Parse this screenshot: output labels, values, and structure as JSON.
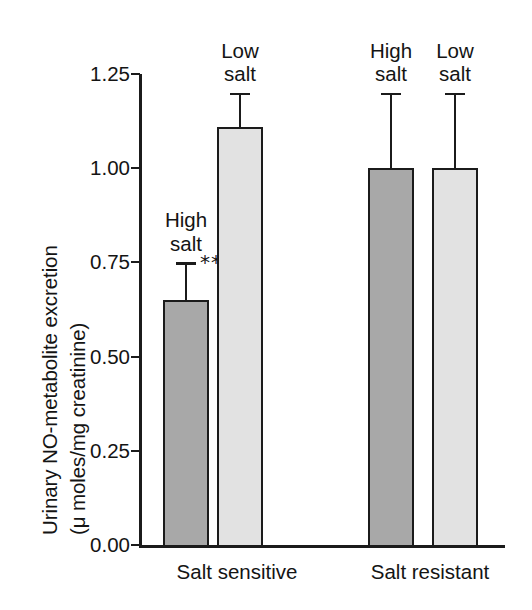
{
  "chart_data": {
    "type": "bar",
    "title": "",
    "xlabel": "",
    "ylabel_line1": "Urinary NO-metabolite excretion",
    "ylabel_line2": "(μ moles/mg creatinine)",
    "ylim": [
      0.0,
      1.25
    ],
    "yticks": [
      "0.00",
      "0.25",
      "0.50",
      "0.75",
      "1.00",
      "1.25"
    ],
    "ytick_values": [
      0.0,
      0.25,
      0.5,
      0.75,
      1.0,
      1.25
    ],
    "grid": false,
    "legend": "none",
    "groups": [
      {
        "name": "Salt sensitive",
        "label": "Salt sensitive",
        "bars": [
          {
            "label_line1": "High",
            "label_line2": "salt",
            "value": 0.65,
            "error": 0.1,
            "fill": "#a8a8a8",
            "significance": "**"
          },
          {
            "label_line1": "Low",
            "label_line2": "salt",
            "value": 1.11,
            "error": 0.09,
            "fill": "#e2e2e2",
            "significance": ""
          }
        ]
      },
      {
        "name": "Salt resistant",
        "label": "Salt resistant",
        "bars": [
          {
            "label_line1": "High",
            "label_line2": "salt",
            "value": 1.0,
            "error": 0.2,
            "fill": "#a8a8a8",
            "significance": ""
          },
          {
            "label_line1": "Low",
            "label_line2": "salt",
            "value": 1.0,
            "error": 0.2,
            "fill": "#e2e2e2",
            "significance": ""
          }
        ]
      }
    ]
  }
}
